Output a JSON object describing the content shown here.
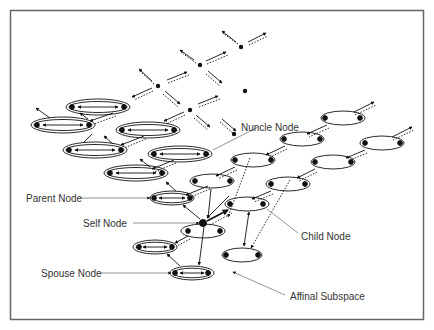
{
  "figure": {
    "title": "",
    "labels": {
      "nuncle": "Nuncle Node",
      "parent": "Parent Node",
      "self": "Self Node",
      "child": "Child Node",
      "spouse": "Spouse Node",
      "affinal": "Affinal Subspace"
    },
    "colors": {
      "ink": "#111111",
      "frame": "#666666",
      "leader": "#777777",
      "text": "#333333"
    }
  }
}
